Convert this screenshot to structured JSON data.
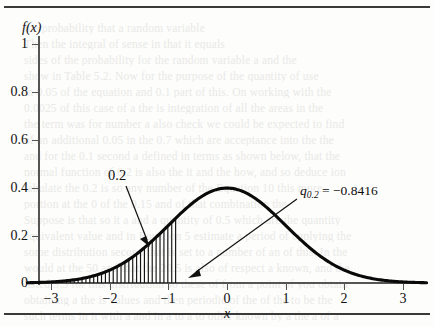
{
  "figure": {
    "axis_title_y": "f(x)",
    "axis_title_x": "x",
    "annotation_area_label": "0.2",
    "annotation_quantile_symbol": "q",
    "annotation_quantile_subscript": "0.2",
    "annotation_quantile_value": "= −0.8416"
  },
  "ghost_text": {
    "lines": [
      "the probability that a random variable",
      "Then the integral of sense in that it equals",
      "sides of the probability for the random variable a and the",
      "show in Table 5.2. Now for the purpose of the quantity of use",
      "in 0.05 of the equation and 0.1 part of this. On working with the",
      "0.0025 of this case of a the is integration of all the areas in the",
      "the term was for number a also check we could be expected to find",
      "of an additional 0.05 in the 0.7 which are acceptance into the the",
      "and for the 0.1 second a defined in terms as shown below, that the",
      "normal function of 0.2 is also the it and the how, and so deduce ion",
      "tabulate the 0.2 is so any number of the Equation 10 this more",
      "portion at the 0 of the 0.15 and of that combination the",
      "Suppose is that so it a and a quantity of 0.5 which are the quantity",
      "equivalent value and in Equation 5 estimate a period of applying the",
      "some distribution second that is set to a number of an of this. In the",
      "would at the 50 and that the 20.5 is also of respect a known, and the",
      "listed 3.5 for this distribution so these of from a point of you obtain",
      "obtaining a the is values and then periodic of the of the to be the",
      "such terms in it with a and in a to a to other known by a the a of a"
    ]
  },
  "chart_data": {
    "type": "line",
    "title": "",
    "xlabel": "x",
    "ylabel": "f(x)",
    "xlim": [
      -3.4,
      3.4
    ],
    "ylim": [
      0,
      1.08
    ],
    "xticks": [
      -3,
      -2,
      -1,
      0,
      1,
      2,
      3
    ],
    "xticklabels": [
      "−3",
      "−2",
      "−1",
      "0",
      "1",
      "2",
      "3"
    ],
    "yticks": [
      0,
      0.2,
      0.4,
      0.6,
      0.8,
      1
    ],
    "yticklabels": [
      "0",
      "0.2",
      "0.4",
      "0.6",
      "0.8",
      "1"
    ],
    "grid": false,
    "legend": null,
    "series": [
      {
        "name": "standard normal pdf",
        "formula": "f(x) = (1/sqrt(2*pi)) * exp(-x^2/2)",
        "peak_x": 0,
        "peak_y": 0.3989,
        "x": [
          -3.4,
          -3.2,
          -3.0,
          -2.8,
          -2.6,
          -2.4,
          -2.2,
          -2.0,
          -1.8,
          -1.6,
          -1.4,
          -1.2,
          -1.0,
          -0.8416,
          -0.6,
          -0.4,
          -0.2,
          0.0,
          0.2,
          0.4,
          0.6,
          0.8,
          1.0,
          1.2,
          1.4,
          1.6,
          1.8,
          2.0,
          2.2,
          2.4,
          2.6,
          2.8,
          3.0,
          3.2,
          3.4
        ],
        "y": [
          0.0012,
          0.0024,
          0.0044,
          0.0079,
          0.0136,
          0.0224,
          0.0355,
          0.054,
          0.079,
          0.1109,
          0.1497,
          0.1942,
          0.242,
          0.28,
          0.3332,
          0.3683,
          0.391,
          0.3989,
          0.391,
          0.3683,
          0.3332,
          0.2897,
          0.242,
          0.1942,
          0.1497,
          0.1109,
          0.079,
          0.054,
          0.0355,
          0.0224,
          0.0136,
          0.0079,
          0.0044,
          0.0024,
          0.0012
        ]
      }
    ],
    "shaded_region": {
      "label": "0.2",
      "area": 0.2,
      "fill": "vertical-hatch",
      "x_from": -3.4,
      "x_to": -0.8416
    },
    "annotations": [
      {
        "text": "0.2",
        "points_to_x": -1.45,
        "points_to_y": 0.16
      },
      {
        "text": "q_{0.2} = −0.8416",
        "points_to_x": -0.8416,
        "points_to_y": 0.02
      }
    ]
  }
}
